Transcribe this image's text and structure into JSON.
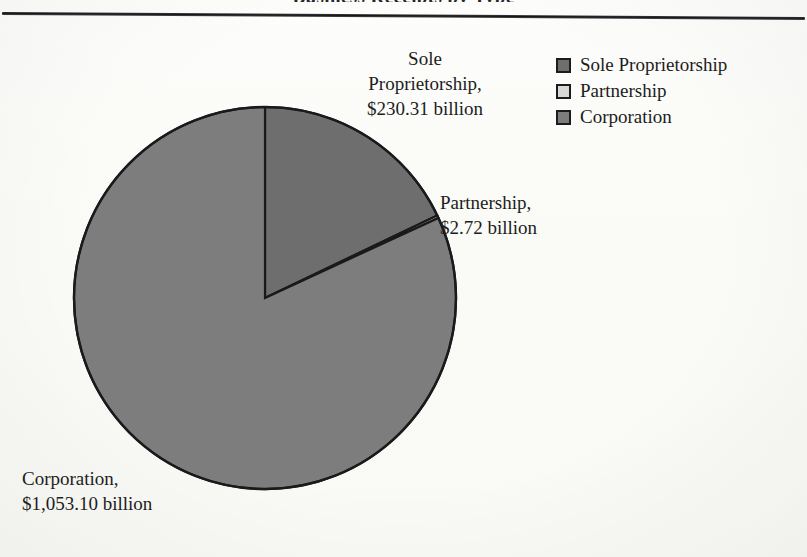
{
  "page": {
    "title_remnant": "Business Receipts by Type",
    "background_color": "#fbfbf9"
  },
  "legend": {
    "position": "top-right",
    "items": [
      {
        "label": "Sole Proprietorship",
        "color": "#6e6e6e",
        "swatch_name": "legend-swatch-sole-proprietorship"
      },
      {
        "label": "Partnership",
        "color": "#d8d8d8",
        "swatch_name": "legend-swatch-partnership"
      },
      {
        "label": "Corporation",
        "color": "#7d7d7d",
        "swatch_name": "legend-swatch-corporation"
      }
    ]
  },
  "labels": {
    "sole_proprietorship": "Sole\nProprietorship,\n$230.31 billion",
    "partnership": "Partnership,\n$2.72 billion",
    "corporation": "Corporation,\n$1,053.10 billion"
  },
  "chart_data": {
    "type": "pie",
    "title": "Business Receipts by Type",
    "xlabel": "",
    "ylabel": "",
    "unit": "billion USD",
    "categories": [
      "Sole Proprietorship",
      "Partnership",
      "Corporation"
    ],
    "values": [
      230.31,
      2.72,
      1053.1
    ],
    "value_labels": [
      "$230.31 billion",
      "$2.72 billion",
      "$1,053.10 billion"
    ],
    "percentages": [
      17.9,
      0.2,
      81.9
    ],
    "colors": [
      "#6e6e6e",
      "#d8d8d8",
      "#7d7d7d"
    ],
    "start_angle_deg": 0,
    "direction": "clockwise",
    "legend_position": "top-right",
    "grid": false,
    "slices": [
      {
        "name": "Sole Proprietorship",
        "value": 230.31,
        "percent": 17.9,
        "color": "#6e6e6e",
        "start_deg": 0.0,
        "end_deg": 64.4
      },
      {
        "name": "Partnership",
        "value": 2.72,
        "percent": 0.2,
        "color": "#d8d8d8",
        "start_deg": 64.4,
        "end_deg": 65.2
      },
      {
        "name": "Corporation",
        "value": 1053.1,
        "percent": 81.9,
        "color": "#7d7d7d",
        "start_deg": 65.2,
        "end_deg": 360.0
      }
    ],
    "total": 1286.13
  },
  "geometry": {
    "center_x": 193,
    "center_y": 193,
    "radius": 191,
    "outline_color": "#1a1a1d"
  }
}
